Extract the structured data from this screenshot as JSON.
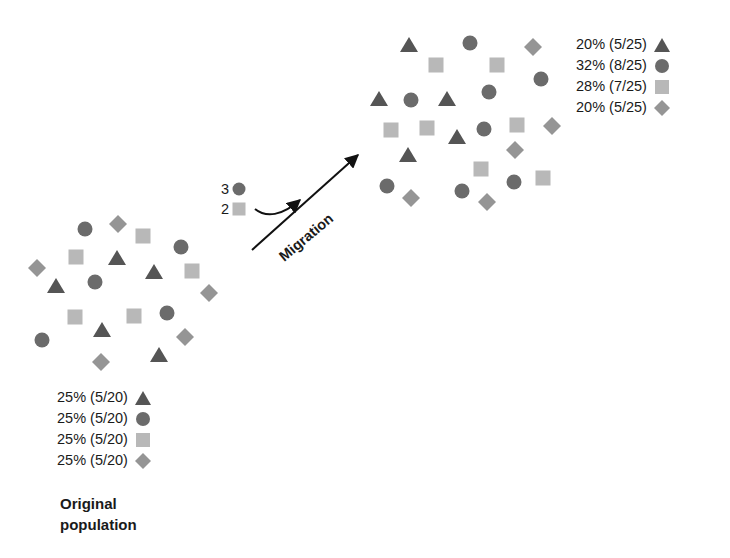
{
  "colors": {
    "triangle": "#555555",
    "circle": "#6b6b6b",
    "square": "#b8b8b8",
    "diamond": "#959595",
    "text": "#1a1a1a",
    "arrow": "#111111"
  },
  "original_population": {
    "title_line1": "Original",
    "title_line2": "population",
    "legend": [
      {
        "shape": "triangle",
        "label": "25% (5/20)"
      },
      {
        "shape": "circle",
        "label": "25% (5/20)"
      },
      {
        "shape": "square",
        "label": "25% (5/20)"
      },
      {
        "shape": "diamond",
        "label": "25% (5/20)"
      }
    ],
    "individuals": [
      {
        "shape": "circle",
        "x": 85,
        "y": 229
      },
      {
        "shape": "diamond",
        "x": 118,
        "y": 224
      },
      {
        "shape": "square",
        "x": 143,
        "y": 236
      },
      {
        "shape": "circle",
        "x": 181,
        "y": 247
      },
      {
        "shape": "square",
        "x": 76,
        "y": 257
      },
      {
        "shape": "triangle",
        "x": 117,
        "y": 258
      },
      {
        "shape": "diamond",
        "x": 37,
        "y": 268
      },
      {
        "shape": "triangle",
        "x": 154,
        "y": 272
      },
      {
        "shape": "square",
        "x": 192,
        "y": 271
      },
      {
        "shape": "triangle",
        "x": 56,
        "y": 286
      },
      {
        "shape": "circle",
        "x": 95,
        "y": 282
      },
      {
        "shape": "diamond",
        "x": 209,
        "y": 293
      },
      {
        "shape": "square",
        "x": 75,
        "y": 317
      },
      {
        "shape": "square",
        "x": 134,
        "y": 316
      },
      {
        "shape": "circle",
        "x": 167,
        "y": 313
      },
      {
        "shape": "circle",
        "x": 42,
        "y": 340
      },
      {
        "shape": "triangle",
        "x": 102,
        "y": 330
      },
      {
        "shape": "diamond",
        "x": 185,
        "y": 337
      },
      {
        "shape": "diamond",
        "x": 101,
        "y": 362
      },
      {
        "shape": "triangle",
        "x": 159,
        "y": 355
      }
    ]
  },
  "migration": {
    "label": "Migration",
    "migrants": [
      {
        "shape": "circle",
        "count": "3"
      },
      {
        "shape": "square",
        "count": "2"
      }
    ]
  },
  "new_population": {
    "legend": [
      {
        "shape": "triangle",
        "label": "20% (5/25)"
      },
      {
        "shape": "circle",
        "label": "32% (8/25)"
      },
      {
        "shape": "square",
        "label": "28% (7/25)"
      },
      {
        "shape": "diamond",
        "label": "20% (5/25)"
      }
    ],
    "individuals": [
      {
        "shape": "triangle",
        "x": 409,
        "y": 45
      },
      {
        "shape": "circle",
        "x": 470,
        "y": 43
      },
      {
        "shape": "diamond",
        "x": 533,
        "y": 47
      },
      {
        "shape": "square",
        "x": 436,
        "y": 65
      },
      {
        "shape": "square",
        "x": 497,
        "y": 65
      },
      {
        "shape": "circle",
        "x": 541,
        "y": 79
      },
      {
        "shape": "triangle",
        "x": 379,
        "y": 99
      },
      {
        "shape": "circle",
        "x": 411,
        "y": 100
      },
      {
        "shape": "triangle",
        "x": 447,
        "y": 99
      },
      {
        "shape": "circle",
        "x": 489,
        "y": 92
      },
      {
        "shape": "square",
        "x": 391,
        "y": 130
      },
      {
        "shape": "square",
        "x": 427,
        "y": 128
      },
      {
        "shape": "triangle",
        "x": 457,
        "y": 137
      },
      {
        "shape": "circle",
        "x": 484,
        "y": 129
      },
      {
        "shape": "square",
        "x": 517,
        "y": 125
      },
      {
        "shape": "diamond",
        "x": 552,
        "y": 126
      },
      {
        "shape": "triangle",
        "x": 408,
        "y": 155
      },
      {
        "shape": "diamond",
        "x": 515,
        "y": 150
      },
      {
        "shape": "square",
        "x": 481,
        "y": 169
      },
      {
        "shape": "square",
        "x": 543,
        "y": 178
      },
      {
        "shape": "circle",
        "x": 387,
        "y": 186
      },
      {
        "shape": "diamond",
        "x": 411,
        "y": 198
      },
      {
        "shape": "circle",
        "x": 462,
        "y": 191
      },
      {
        "shape": "diamond",
        "x": 487,
        "y": 202
      },
      {
        "shape": "circle",
        "x": 514,
        "y": 182
      }
    ]
  }
}
